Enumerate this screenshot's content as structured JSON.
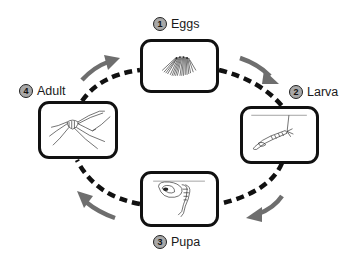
{
  "diagram": {
    "type": "life-cycle",
    "colors": {
      "box_border": "#111111",
      "dashed_path": "#111111",
      "arrow": "#6e6e6e",
      "number_badge": "#a8a8a8",
      "background": "#ffffff"
    },
    "stages": [
      {
        "number": "1",
        "label": "Eggs",
        "illustration": "egg-raft-icon"
      },
      {
        "number": "2",
        "label": "Larva",
        "illustration": "larva-icon"
      },
      {
        "number": "3",
        "label": "Pupa",
        "illustration": "pupa-icon"
      },
      {
        "number": "4",
        "label": "Adult",
        "illustration": "mosquito-icon"
      }
    ],
    "flow_direction": "clockwise"
  }
}
